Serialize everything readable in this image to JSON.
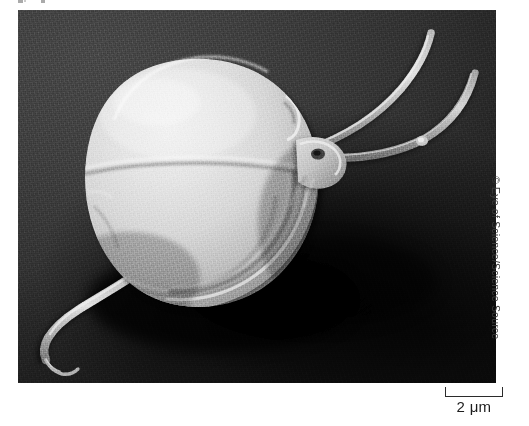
{
  "figure": {
    "kind": "scanning-electron-micrograph",
    "subject_description": "Flagellated protozoan cell with a rounded body, two long anterior flagella curving to the upper right and one posterior flagellum trailing to the lower left, resting on a dark substrate with a cast shadow."
  },
  "credit": {
    "text": "© Eye of Science/Science Source",
    "symbol": "©",
    "owner": "Eye of Science",
    "distributor": "Science Source",
    "orientation": "vertical-right-edge",
    "color": "#3c3c3c"
  },
  "scale_bar": {
    "label": "2 μm",
    "value": 2,
    "unit": "μm",
    "bar_style": "bracket-ticks-up",
    "color": "#2b2b2b"
  },
  "micrograph": {
    "background_color": "#3a3a3a",
    "shadow_color": "#000000",
    "specimen_color": "#d8d8d8",
    "specimen_highlight": "#f2f2f2",
    "specimen_shadow": "#7e7e7e",
    "frame": {
      "left": 18,
      "top": 10,
      "width": 478,
      "height": 373
    }
  },
  "page": {
    "background_color": "#ffffff",
    "width": 529,
    "height": 426
  }
}
